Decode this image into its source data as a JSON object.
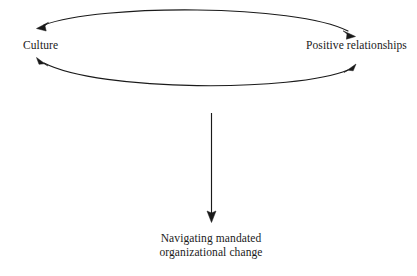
{
  "diagram": {
    "type": "conceptual-model",
    "background_color": "#ffffff",
    "stroke_color": "#1a1a1a",
    "nodes": [
      {
        "id": "culture",
        "label": "Culture",
        "position": "left"
      },
      {
        "id": "positive_relationships",
        "label": "Positive relationships",
        "position": "right"
      },
      {
        "id": "outcome",
        "label_line_1": "Navigating mandated",
        "label_line_2": "organizational change",
        "position": "bottom-center"
      }
    ],
    "connectors": [
      {
        "id": "top-arc",
        "shape": "arc-curving-up",
        "from": "positive_relationships",
        "to": "culture",
        "arrowheads": "both",
        "description": "Bidirectional curved arrow above the two labels"
      },
      {
        "id": "bottom-arc",
        "shape": "arc-curving-down",
        "from": "culture",
        "to": "positive_relationships",
        "arrowheads": "both",
        "description": "Bidirectional curved arrow below the two labels"
      },
      {
        "id": "vertical-arrow",
        "shape": "straight-line",
        "from": "culture-and-positive-relationships",
        "to": "outcome",
        "arrowheads": "end",
        "description": "Downward arrow pointing to the outcome node"
      }
    ]
  }
}
